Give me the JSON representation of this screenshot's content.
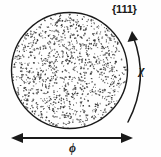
{
  "figure": {
    "background_color": "#fefefe",
    "ink_color": "#1a1a1a",
    "stipple_color": "#4a4a4a"
  },
  "labels": {
    "plane": "{111}",
    "chi": "χ",
    "phi": "ϕ"
  },
  "chart_data": {
    "type": "scatter",
    "xlabel": "ϕ",
    "ylabel": "χ",
    "legend": [],
    "grid": false,
    "annotations": [
      {
        "text": "{111}",
        "role": "plane-index",
        "position": "top-right"
      },
      {
        "text": "χ",
        "role": "tilt-angle",
        "position": "right"
      },
      {
        "text": "ϕ",
        "role": "rotation-angle",
        "position": "bottom"
      }
    ],
    "circle": {
      "center_x": 69.5,
      "center_y": 70.5,
      "radius": 58,
      "stroke_width": 1.4,
      "fill": "none"
    },
    "stipple": {
      "count": 1150,
      "seed": 20240513,
      "min_size": 0.7,
      "max_size": 1.9,
      "distribution": "uniform-random-in-disk"
    },
    "chi_arc": {
      "start_x": 128,
      "start_y": 122,
      "end_x": 133,
      "end_y": 36,
      "control_x": 150,
      "control_y": 80,
      "arrow_at": "end",
      "direction": "counterclockwise-upward"
    },
    "phi_arrow": {
      "x1": 11,
      "x2": 133,
      "y": 138,
      "heads": "both",
      "orientation": "horizontal"
    }
  }
}
